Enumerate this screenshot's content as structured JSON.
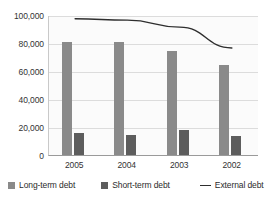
{
  "chart_data": {
    "type": "bar",
    "title": "",
    "subtitle": "",
    "xlabel": "",
    "ylabel": "",
    "categories": [
      "2005",
      "2004",
      "2003",
      "2002"
    ],
    "ylim": [
      0,
      100000
    ],
    "yticks": [
      0,
      20000,
      40000,
      60000,
      80000,
      100000
    ],
    "ytick_labels": [
      "0",
      "20,000",
      "40,000",
      "60,000",
      "80,000",
      "100,000"
    ],
    "grid": true,
    "legend_position": "bottom",
    "series": [
      {
        "name": "Long-term debt",
        "type": "bar",
        "color": "#8a8a8a",
        "values": [
          80500,
          80500,
          74500,
          64000
        ]
      },
      {
        "name": "Short-term debt",
        "type": "bar",
        "color": "#5d5d5d",
        "values": [
          16000,
          14500,
          18000,
          13500
        ]
      },
      {
        "name": "External debt",
        "type": "line",
        "color": "#2e2e2e",
        "values": [
          98000,
          97000,
          92000,
          77000
        ]
      }
    ]
  },
  "legend": {
    "items": [
      {
        "label": "Long-term debt",
        "marker": "square",
        "color": "#8a8a8a"
      },
      {
        "label": "Short-term debt",
        "marker": "square",
        "color": "#5d5d5d"
      },
      {
        "label": "External debt",
        "marker": "line",
        "color": "#2e2e2e"
      }
    ]
  }
}
